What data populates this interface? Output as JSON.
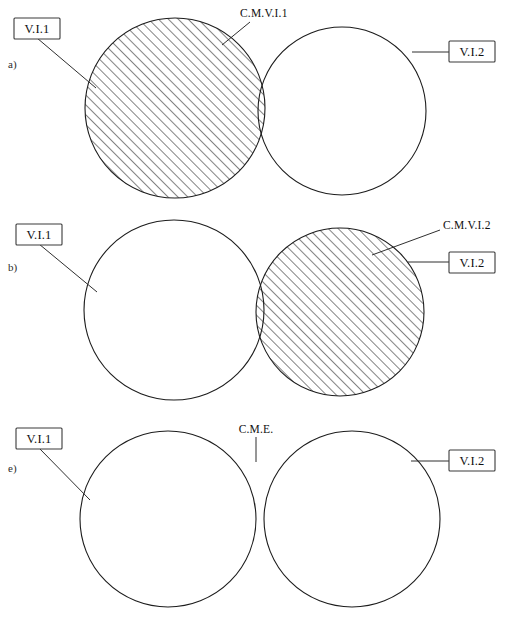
{
  "figure": {
    "width": 509,
    "height": 622,
    "background_color": "#ffffff",
    "line_color": "#1c1c1c",
    "hatch_color": "#141414"
  },
  "panels": [
    {
      "id": "a",
      "letter": "a)",
      "left_circle_label": "V.I.1",
      "right_circle_label": "V.I.2",
      "callout_label": "C.M.V.I.1",
      "shaded_region": "left-circle",
      "left_circle": {
        "cx": 175,
        "cy": 108,
        "r": 90
      },
      "right_circle": {
        "cx": 342,
        "cy": 111,
        "r": 84
      }
    },
    {
      "id": "b",
      "letter": "b)",
      "left_circle_label": "V.I.1",
      "right_circle_label": "V.I.2",
      "callout_label": "C.M.V.I.2",
      "shaded_region": "right-circle",
      "left_circle": {
        "cx": 174,
        "cy": 310,
        "r": 90
      },
      "right_circle": {
        "cx": 340,
        "cy": 312,
        "r": 84
      }
    },
    {
      "id": "c",
      "letter": "e)",
      "left_circle_label": "V.I.1",
      "right_circle_label": "V.I.2",
      "callout_label": "C.M.E.",
      "shaded_region": "intersection",
      "left_circle": {
        "cx": 168,
        "cy": 519,
        "r": 88
      },
      "right_circle": {
        "cx": 352,
        "cy": 519,
        "r": 88
      }
    }
  ],
  "hatching": {
    "angle_degrees": 45,
    "spacing_px": 7,
    "direction": "lower-left to upper-right"
  }
}
